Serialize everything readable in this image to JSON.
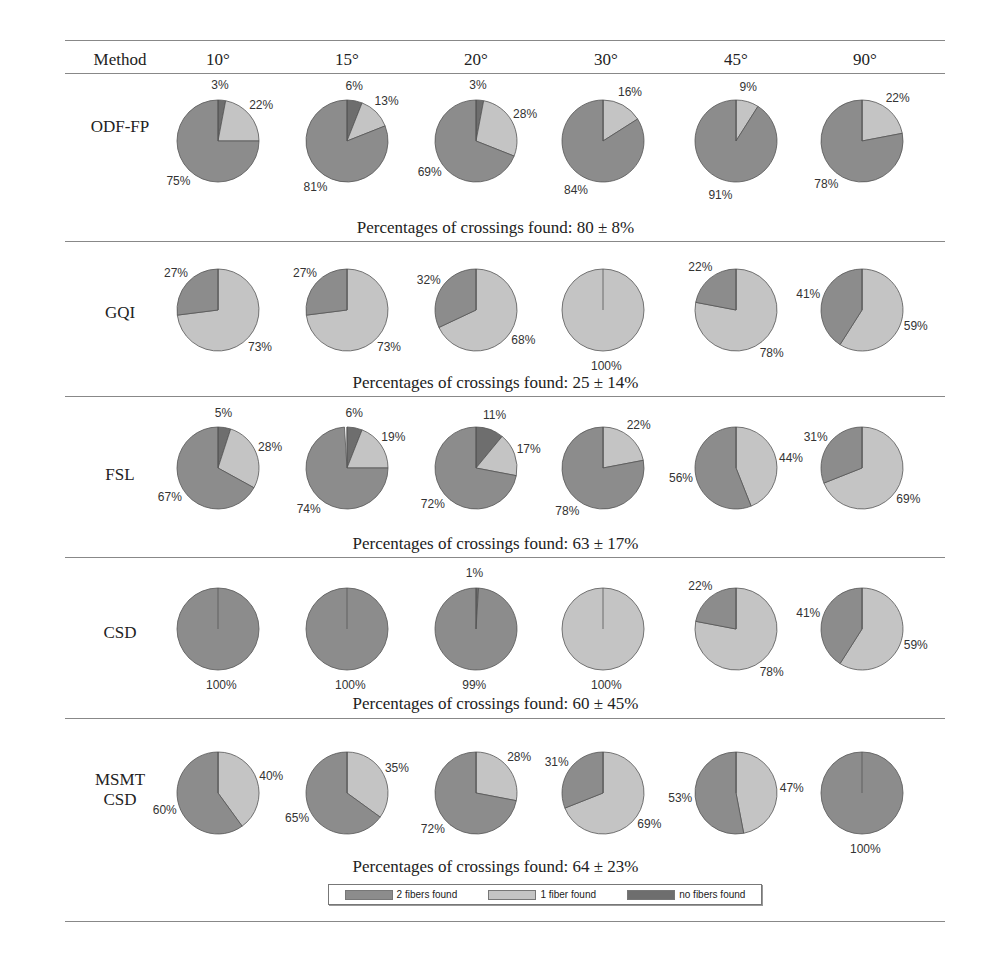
{
  "header": {
    "method_label": "Method",
    "angles": [
      "10°",
      "15°",
      "20°",
      "30°",
      "45°",
      "90°"
    ]
  },
  "colors": {
    "two_fibers": "#8c8c8c",
    "one_fiber": "#c4c4c4",
    "no_fibers": "#6e6e6e",
    "rule": "#888888"
  },
  "legend": {
    "two_fibers": "2 fibers found",
    "one_fiber": "1 fiber found",
    "no_fibers": "no fibers found"
  },
  "rows": [
    {
      "method": "ODF-FP",
      "summary": "Percentages of crossings found: 80 ± 8%"
    },
    {
      "method": "GQI",
      "summary": "Percentages of crossings found: 25 ± 14%"
    },
    {
      "method": "FSL",
      "summary": "Percentages of crossings found: 63 ± 17%"
    },
    {
      "method": "CSD",
      "summary": "Percentages of crossings found: 60 ± 45%"
    },
    {
      "method": "MSMT\nCSD",
      "summary": "Percentages of crossings found: 64 ± 23%"
    }
  ],
  "chart_data": {
    "type": "pie",
    "categories": [
      "10°",
      "15°",
      "20°",
      "30°",
      "45°",
      "90°"
    ],
    "slice_labels": [
      "2 fibers found",
      "1 fiber found",
      "no fibers found"
    ],
    "series": [
      {
        "name": "ODF-FP",
        "summary_mean": 80,
        "summary_sd": 8,
        "values": [
          {
            "two": 75,
            "one": 22,
            "none": 3
          },
          {
            "two": 81,
            "one": 13,
            "none": 6
          },
          {
            "two": 69,
            "one": 28,
            "none": 3
          },
          {
            "two": 84,
            "one": 16,
            "none": 0
          },
          {
            "two": 91,
            "one": 9,
            "none": 0
          },
          {
            "two": 78,
            "one": 22,
            "none": 0
          }
        ]
      },
      {
        "name": "GQI",
        "summary_mean": 25,
        "summary_sd": 14,
        "values": [
          {
            "two": 27,
            "one": 73,
            "none": 0
          },
          {
            "two": 27,
            "one": 73,
            "none": 0
          },
          {
            "two": 32,
            "one": 68,
            "none": 0
          },
          {
            "two": 0,
            "one": 100,
            "none": 0
          },
          {
            "two": 22,
            "one": 78,
            "none": 0
          },
          {
            "two": 41,
            "one": 59,
            "none": 0
          }
        ]
      },
      {
        "name": "FSL",
        "summary_mean": 63,
        "summary_sd": 17,
        "values": [
          {
            "two": 67,
            "one": 28,
            "none": 5
          },
          {
            "two": 74,
            "one": 19,
            "none": 6
          },
          {
            "two": 72,
            "one": 17,
            "none": 11
          },
          {
            "two": 78,
            "one": 22,
            "none": 0
          },
          {
            "two": 56,
            "one": 44,
            "none": 0
          },
          {
            "two": 31,
            "one": 69,
            "none": 0
          }
        ]
      },
      {
        "name": "CSD",
        "summary_mean": 60,
        "summary_sd": 45,
        "values": [
          {
            "two": 100,
            "one": 0,
            "none": 0
          },
          {
            "two": 100,
            "one": 0,
            "none": 0
          },
          {
            "two": 99,
            "one": 0,
            "none": 1
          },
          {
            "two": 0,
            "one": 100,
            "none": 0
          },
          {
            "two": 22,
            "one": 78,
            "none": 0
          },
          {
            "two": 41,
            "one": 59,
            "none": 0
          }
        ]
      },
      {
        "name": "MSMT CSD",
        "summary_mean": 64,
        "summary_sd": 23,
        "values": [
          {
            "two": 60,
            "one": 40,
            "none": 0
          },
          {
            "two": 65,
            "one": 35,
            "none": 0
          },
          {
            "two": 72,
            "one": 28,
            "none": 0
          },
          {
            "two": 31,
            "one": 69,
            "none": 0
          },
          {
            "two": 53,
            "one": 47,
            "none": 0
          },
          {
            "two": 100,
            "one": 0,
            "none": 0
          }
        ]
      }
    ],
    "legend_position": "bottom",
    "grid": false
  }
}
